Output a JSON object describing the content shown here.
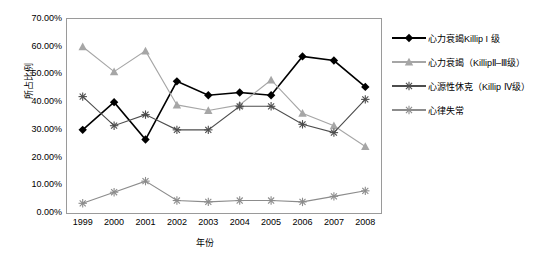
{
  "chart_data": {
    "type": "line",
    "title": "",
    "xlabel": "年份",
    "ylabel": "所占比例",
    "categories": [
      "1999",
      "2000",
      "2001",
      "2002",
      "2003",
      "2004",
      "2005",
      "2006",
      "2007",
      "2008"
    ],
    "ylim": [
      0,
      70
    ],
    "yticks": [
      "0.00%",
      "10.00%",
      "20.00%",
      "30.00%",
      "40.00%",
      "50.00%",
      "60.00%",
      "70.00%"
    ],
    "ytick_values": [
      0,
      10,
      20,
      30,
      40,
      50,
      60,
      70
    ],
    "grid": false,
    "legend_position": "right",
    "series": [
      {
        "name": "心力衰竭Killip I 级",
        "color": "#000000",
        "marker": "diamond",
        "values": [
          30.0,
          40.0,
          26.5,
          47.5,
          42.5,
          43.5,
          42.5,
          56.5,
          55.0,
          45.5
        ]
      },
      {
        "name": "心力衰竭（KillipⅡ–Ⅲ级）",
        "color": "#a6a6a6",
        "marker": "triangle",
        "values": [
          60.0,
          51.0,
          58.5,
          39.0,
          37.0,
          39.0,
          48.0,
          36.0,
          31.5,
          24.0
        ]
      },
      {
        "name": "心源性休克（Killip Ⅳ级）",
        "color": "#4d4d4d",
        "marker": "star",
        "values": [
          42.0,
          31.5,
          35.5,
          30.0,
          30.0,
          38.5,
          38.5,
          32.0,
          29.0,
          41.0
        ]
      },
      {
        "name": "心律失常",
        "color": "#8c8c8c",
        "marker": "star",
        "values": [
          3.5,
          7.5,
          11.5,
          4.5,
          4.0,
          4.5,
          4.5,
          4.0,
          6.0,
          8.0
        ]
      }
    ]
  },
  "axis": {
    "ylabel": "所占比例",
    "xlabel": "年份"
  }
}
